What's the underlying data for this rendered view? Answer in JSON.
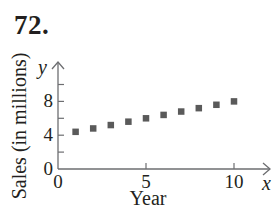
{
  "problem": {
    "number": "72."
  },
  "chart_data": {
    "type": "scatter",
    "title": "",
    "xlabel": "Year",
    "ylabel": "Sales (in millions)",
    "x_axis_var": "x",
    "y_axis_var": "y",
    "x": [
      1,
      2,
      3,
      4,
      5,
      6,
      7,
      8,
      9,
      10
    ],
    "values": [
      4.4,
      4.8,
      5.2,
      5.6,
      6.0,
      6.4,
      6.8,
      7.2,
      7.6,
      8.0
    ],
    "xlim": [
      0,
      11.5
    ],
    "ylim": [
      0,
      12
    ],
    "x_ticks": [
      0,
      5,
      10
    ],
    "x_tick_labels": [
      "0",
      "5",
      "10"
    ],
    "y_ticks": [
      0,
      2,
      4,
      6,
      8,
      10
    ],
    "y_tick_labels": [
      "0",
      "",
      "4",
      "",
      "8",
      ""
    ],
    "grid": false,
    "legend": null,
    "marker": "square",
    "marker_color": "#5a5a5a",
    "axis_color": "#6d6e71"
  }
}
